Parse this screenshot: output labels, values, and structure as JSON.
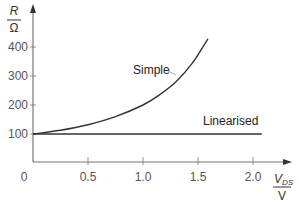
{
  "chart_data": {
    "type": "line",
    "title": "",
    "xlabel": "V_DS / V",
    "ylabel": "R / Ω",
    "xlabel_parts": {
      "numerator": "V",
      "subscript": "DS",
      "denominator": "V"
    },
    "ylabel_parts": {
      "numerator": "R",
      "denominator": "Ω"
    },
    "xlim": [
      0,
      2.3
    ],
    "ylim": [
      0,
      470
    ],
    "x_ticks": [
      0,
      0.5,
      1.0,
      1.5,
      2.0
    ],
    "x_tick_labels": [
      "0",
      "0.5",
      "1.0",
      "1.5",
      "2.0"
    ],
    "y_ticks": [
      100,
      200,
      300,
      400
    ],
    "y_tick_labels": [
      "100",
      "200",
      "300",
      "400"
    ],
    "grid": false,
    "legend": "inline labels",
    "series": [
      {
        "name": "Simple",
        "x": [
          0,
          0.25,
          0.5,
          0.75,
          1.0,
          1.15,
          1.3,
          1.45,
          1.59
        ],
        "values": [
          100,
          113,
          132,
          160,
          200,
          235,
          280,
          345,
          428
        ]
      },
      {
        "name": "Linearised",
        "x": [
          0,
          2.08
        ],
        "values": [
          100,
          100
        ]
      }
    ],
    "annotations": [
      "Simple",
      "Linearised"
    ]
  },
  "labels": {
    "simple": "Simple",
    "linearised": "Linearised",
    "y_num": "R",
    "y_den": "Ω",
    "x_num": "V",
    "x_sub": "DS",
    "x_den": "V",
    "origin": "0"
  },
  "colors": {
    "axis": "#777777",
    "curve": "#333333",
    "text": "#555555"
  }
}
